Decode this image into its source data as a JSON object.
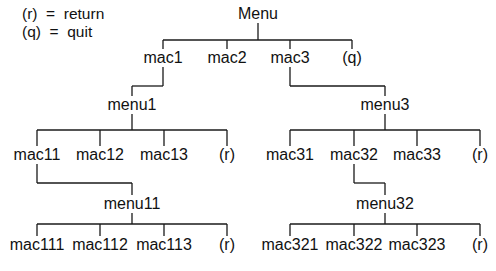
{
  "legend": [
    {
      "key": "(r)",
      "eq": "=",
      "meaning": "return",
      "text": "(r)  =  return"
    },
    {
      "key": "(q)",
      "eq": "=",
      "meaning": "quit",
      "text": "(q)  =  quit"
    }
  ],
  "nodes": [
    {
      "id": "menu",
      "label": "Menu",
      "x": 258,
      "y": 14
    },
    {
      "id": "mac1",
      "label": "mac1",
      "x": 163,
      "y": 58
    },
    {
      "id": "mac2",
      "label": "mac2",
      "x": 227,
      "y": 58
    },
    {
      "id": "mac3",
      "label": "mac3",
      "x": 290,
      "y": 58
    },
    {
      "id": "q",
      "label": "(q)",
      "x": 352,
      "y": 58
    },
    {
      "id": "menu1",
      "label": "menu1",
      "x": 132,
      "y": 105
    },
    {
      "id": "mac11",
      "label": "mac11",
      "x": 37,
      "y": 155
    },
    {
      "id": "mac12",
      "label": "mac12",
      "x": 100,
      "y": 155
    },
    {
      "id": "mac13",
      "label": "mac13",
      "x": 164,
      "y": 155
    },
    {
      "id": "r1",
      "label": "(r)",
      "x": 227,
      "y": 155
    },
    {
      "id": "menu3",
      "label": "menu3",
      "x": 385,
      "y": 105
    },
    {
      "id": "mac31",
      "label": "mac31",
      "x": 290,
      "y": 155
    },
    {
      "id": "mac32",
      "label": "mac32",
      "x": 354,
      "y": 155
    },
    {
      "id": "mac33",
      "label": "mac33",
      "x": 417,
      "y": 155
    },
    {
      "id": "r3",
      "label": "(r)",
      "x": 480,
      "y": 155
    },
    {
      "id": "menu11",
      "label": "menu11",
      "x": 132,
      "y": 204
    },
    {
      "id": "mac111",
      "label": "mac111",
      "x": 37,
      "y": 245
    },
    {
      "id": "mac112",
      "label": "mac112",
      "x": 100,
      "y": 245
    },
    {
      "id": "mac113",
      "label": "mac113",
      "x": 164,
      "y": 245
    },
    {
      "id": "r11",
      "label": "(r)",
      "x": 227,
      "y": 245
    },
    {
      "id": "menu32",
      "label": "menu32",
      "x": 385,
      "y": 204
    },
    {
      "id": "mac321",
      "label": "mac321",
      "x": 290,
      "y": 245
    },
    {
      "id": "mac322",
      "label": "mac322",
      "x": 354,
      "y": 245
    },
    {
      "id": "mac323",
      "label": "mac323",
      "x": 417,
      "y": 245
    },
    {
      "id": "r32",
      "label": "(r)",
      "x": 480,
      "y": 245
    }
  ],
  "edges": [
    [
      258,
      23,
      258,
      40
    ],
    [
      163,
      40,
      352,
      40
    ],
    [
      163,
      40,
      163,
      50
    ],
    [
      227,
      40,
      227,
      50
    ],
    [
      290,
      40,
      290,
      50
    ],
    [
      352,
      40,
      352,
      50
    ],
    [
      163,
      67,
      163,
      86
    ],
    [
      132,
      86,
      163,
      86
    ],
    [
      132,
      86,
      132,
      97
    ],
    [
      132,
      113,
      132,
      130
    ],
    [
      37,
      130,
      227,
      130
    ],
    [
      37,
      130,
      37,
      147
    ],
    [
      100,
      130,
      100,
      147
    ],
    [
      164,
      130,
      164,
      147
    ],
    [
      227,
      130,
      227,
      147
    ],
    [
      290,
      67,
      290,
      86
    ],
    [
      290,
      86,
      385,
      86
    ],
    [
      385,
      86,
      385,
      97
    ],
    [
      385,
      113,
      385,
      130
    ],
    [
      290,
      130,
      480,
      130
    ],
    [
      290,
      130,
      290,
      147
    ],
    [
      354,
      130,
      354,
      147
    ],
    [
      417,
      130,
      417,
      147
    ],
    [
      480,
      130,
      480,
      147
    ],
    [
      37,
      164,
      37,
      183
    ],
    [
      37,
      183,
      132,
      183
    ],
    [
      132,
      183,
      132,
      196
    ],
    [
      132,
      212,
      132,
      224
    ],
    [
      37,
      224,
      227,
      224
    ],
    [
      37,
      224,
      37,
      237
    ],
    [
      100,
      224,
      100,
      237
    ],
    [
      164,
      224,
      164,
      237
    ],
    [
      227,
      224,
      227,
      237
    ],
    [
      354,
      164,
      354,
      183
    ],
    [
      354,
      183,
      385,
      183
    ],
    [
      385,
      183,
      385,
      196
    ],
    [
      385,
      212,
      385,
      224
    ],
    [
      290,
      224,
      480,
      224
    ],
    [
      290,
      224,
      290,
      237
    ],
    [
      354,
      224,
      354,
      237
    ],
    [
      417,
      224,
      417,
      237
    ],
    [
      480,
      224,
      480,
      237
    ]
  ]
}
